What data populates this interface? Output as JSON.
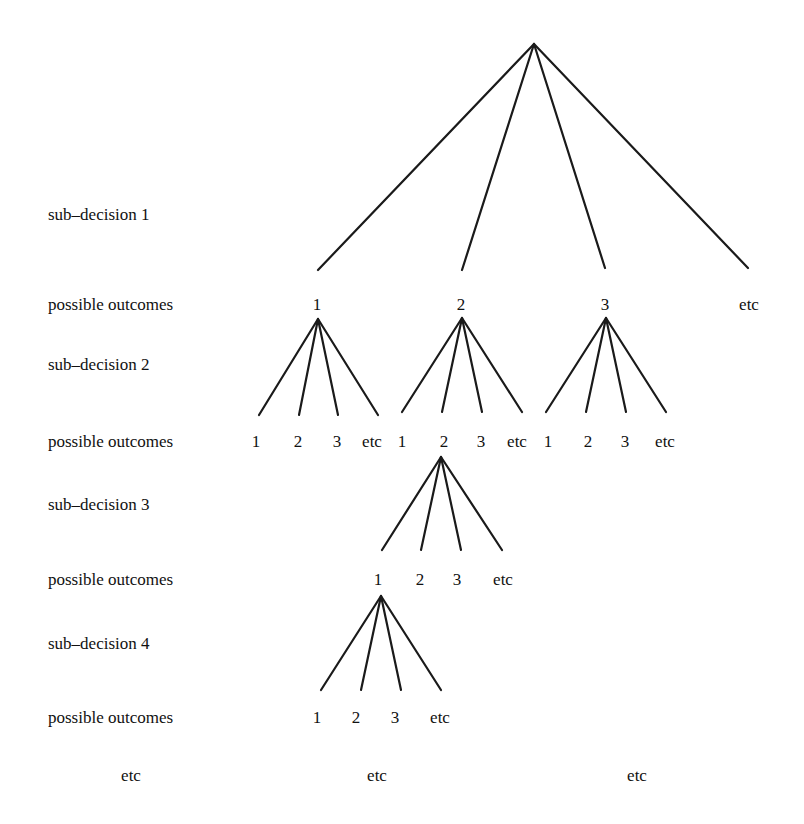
{
  "row_labels": [
    {
      "text": "sub–decision 1",
      "y": 205
    },
    {
      "text": "possible outcomes",
      "y": 295
    },
    {
      "text": "sub–decision 2",
      "y": 355
    },
    {
      "text": "possible outcomes",
      "y": 432
    },
    {
      "text": "sub–decision 3",
      "y": 495
    },
    {
      "text": "possible outcomes",
      "y": 570
    },
    {
      "text": "sub–decision 4",
      "y": 634
    },
    {
      "text": "possible outcomes",
      "y": 708
    }
  ],
  "levels": [
    {
      "name": "sub-decision 1",
      "apex": [
        534,
        44
      ],
      "ends": [
        [
          318,
          270
        ],
        [
          462,
          270
        ],
        [
          605,
          268
        ],
        [
          748,
          268
        ]
      ],
      "outcomes": [
        {
          "text": "1",
          "x": 317,
          "y": 295
        },
        {
          "text": "2",
          "x": 461,
          "y": 295
        },
        {
          "text": "3",
          "x": 605,
          "y": 295
        },
        {
          "text": "etc",
          "x": 749,
          "y": 295
        }
      ]
    },
    {
      "name": "sub-decision 2 (from outcome 1)",
      "apex": [
        318,
        319
      ],
      "ends": [
        [
          259,
          415
        ],
        [
          299,
          415
        ],
        [
          338,
          415
        ],
        [
          378,
          415
        ]
      ],
      "outcomes": [
        {
          "text": "1",
          "x": 256,
          "y": 432
        },
        {
          "text": "2",
          "x": 298,
          "y": 432
        },
        {
          "text": "3",
          "x": 337,
          "y": 432
        },
        {
          "text": "etc",
          "x": 372,
          "y": 432
        }
      ]
    },
    {
      "name": "sub-decision 2 (from outcome 2)",
      "apex": [
        462,
        318
      ],
      "ends": [
        [
          402,
          412
        ],
        [
          442,
          412
        ],
        [
          482,
          412
        ],
        [
          522,
          412
        ]
      ],
      "outcomes": [
        {
          "text": "1",
          "x": 402,
          "y": 432
        },
        {
          "text": "2",
          "x": 444,
          "y": 432
        },
        {
          "text": "3",
          "x": 481,
          "y": 432
        },
        {
          "text": "etc",
          "x": 517,
          "y": 432
        }
      ]
    },
    {
      "name": "sub-decision 2 (from outcome 3)",
      "apex": [
        606,
        318
      ],
      "ends": [
        [
          546,
          412
        ],
        [
          586,
          412
        ],
        [
          626,
          412
        ],
        [
          666,
          412
        ]
      ],
      "outcomes": [
        {
          "text": "1",
          "x": 548,
          "y": 432
        },
        {
          "text": "2",
          "x": 588,
          "y": 432
        },
        {
          "text": "3",
          "x": 625,
          "y": 432
        },
        {
          "text": "etc",
          "x": 665,
          "y": 432
        }
      ]
    },
    {
      "name": "sub-decision 3",
      "apex": [
        441,
        457
      ],
      "ends": [
        [
          382,
          550
        ],
        [
          421,
          550
        ],
        [
          461,
          550
        ],
        [
          502,
          550
        ]
      ],
      "outcomes": [
        {
          "text": "1",
          "x": 378,
          "y": 570
        },
        {
          "text": "2",
          "x": 420,
          "y": 570
        },
        {
          "text": "3",
          "x": 457,
          "y": 570
        },
        {
          "text": "etc",
          "x": 503,
          "y": 570
        }
      ]
    },
    {
      "name": "sub-decision 4",
      "apex": [
        381,
        596
      ],
      "ends": [
        [
          321,
          690
        ],
        [
          361,
          690
        ],
        [
          401,
          690
        ],
        [
          441,
          690
        ]
      ],
      "outcomes": [
        {
          "text": "1",
          "x": 317,
          "y": 708
        },
        {
          "text": "2",
          "x": 356,
          "y": 708
        },
        {
          "text": "3",
          "x": 395,
          "y": 708
        },
        {
          "text": "etc",
          "x": 440,
          "y": 708
        }
      ]
    }
  ],
  "footer_etc": [
    {
      "text": "etc",
      "x": 131,
      "y": 766
    },
    {
      "text": "etc",
      "x": 377,
      "y": 766
    },
    {
      "text": "etc",
      "x": 637,
      "y": 766
    }
  ]
}
